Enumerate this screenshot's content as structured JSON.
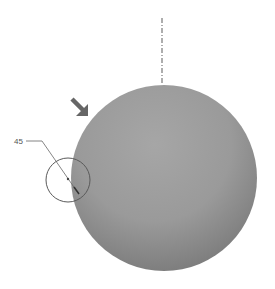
{
  "diagram": {
    "annotation_label": "45",
    "colors": {
      "sphere_light": "#a2a2a2",
      "sphere_dark": "#7a7a7a",
      "arrow": "#666666",
      "lines": "#666666",
      "background": "#ffffff"
    },
    "elements": {
      "sphere": "shaded sphere",
      "centerline": "vertical dash-dot centerline above sphere",
      "arrow": "thick arrow pointing to sphere upper-left edge",
      "detail_circle": "detail callout circle on left edge",
      "leader": "leader line from label to detail point"
    }
  }
}
